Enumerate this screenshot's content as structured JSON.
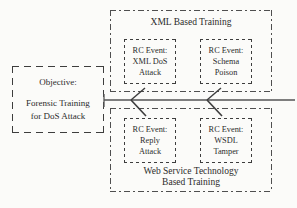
{
  "diagram": {
    "colors": {
      "stroke": "#3d3d3d",
      "dashdot_stroke": "#4f4f4f",
      "trunk": "#555555",
      "text": "#2b2b2b",
      "background": "#fbfbf9"
    }
  },
  "objective": {
    "heading": "Objective:",
    "body_line1": "Forensic Training",
    "body_line2": "for DoS Attack"
  },
  "groups": [
    {
      "id": "xml-based-training",
      "label": "XML Based Training",
      "label_position": "top",
      "events": [
        {
          "id": "xml-dos-attack",
          "line1": "RC Event:",
          "line2": "XML DoS",
          "line3": "Attack"
        },
        {
          "id": "schema-poison",
          "line1": "RC Event:",
          "line2": "Schema",
          "line3": "Poison"
        }
      ]
    },
    {
      "id": "web-service-technology-based-training",
      "label_line1": "Web Service Technology",
      "label_line2": "Based Training",
      "label_position": "bottom",
      "events": [
        {
          "id": "reply-attack",
          "line1": "RC Event:",
          "line2": "Reply",
          "line3": "Attack"
        },
        {
          "id": "wsdl-tamper",
          "line1": "RC Event:",
          "line2": "WSDL",
          "line3": "Tamper"
        }
      ]
    }
  ],
  "connectors": {
    "trunk_label": "",
    "branch_count": 4
  }
}
